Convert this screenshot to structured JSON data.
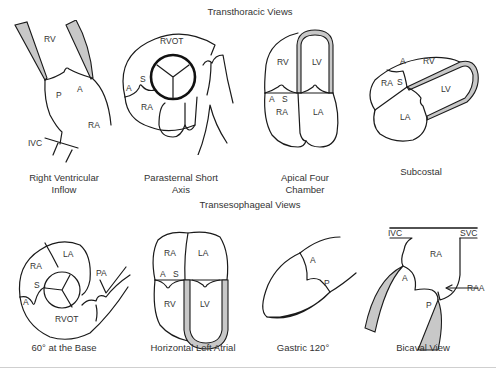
{
  "figure": {
    "sections": [
      {
        "title": "Transthoracic Views",
        "views": [
          {
            "caption_line1": "Right Ventricular",
            "caption_line2": "Inflow",
            "labels": {
              "rv": "RV",
              "p": "P",
              "a": "A",
              "ra": "RA",
              "ivc": "IVC"
            }
          },
          {
            "caption_line1": "Parasternal Short",
            "caption_line2": "Axis",
            "labels": {
              "rvot": "RVOT",
              "a": "A",
              "s": "S",
              "ra": "RA"
            }
          },
          {
            "caption_line1": "Apical Four",
            "caption_line2": "Chamber",
            "labels": {
              "rv": "RV",
              "lv": "LV",
              "a": "A",
              "s": "S",
              "ra": "RA",
              "la": "LA"
            }
          },
          {
            "caption_line1": "Subcostal",
            "caption_line2": "",
            "labels": {
              "a": "A",
              "rv": "RV",
              "ra": "RA",
              "s": "S",
              "lv": "LV",
              "la": "LA"
            }
          }
        ]
      },
      {
        "title": "Transesophageal Views",
        "views": [
          {
            "caption_line1": "60° at the Base",
            "caption_line2": "",
            "labels": {
              "ra": "RA",
              "la": "LA",
              "s": "S",
              "a": "A",
              "pa": "PA",
              "rvot": "RVOT"
            }
          },
          {
            "caption_line1": "Horizontal Left Atrial",
            "caption_line2": "",
            "labels": {
              "ra": "RA",
              "la": "LA",
              "a": "A",
              "s": "S",
              "rv": "RV",
              "lv": "LV"
            }
          },
          {
            "caption_line1": "Gastric 120°",
            "caption_line2": "",
            "labels": {
              "a": "A",
              "p": "P"
            }
          },
          {
            "caption_line1": "Bicaval View",
            "caption_line2": "",
            "labels": {
              "ivc": "IVC",
              "svc": "SVC",
              "ra": "RA",
              "a": "A",
              "p": "P",
              "raa": "RAA"
            }
          }
        ]
      }
    ],
    "colors": {
      "line": "#1a1a1a",
      "wall_fill": "#c8c8c8",
      "text": "#333333",
      "rule": "#cfcfcf"
    }
  }
}
